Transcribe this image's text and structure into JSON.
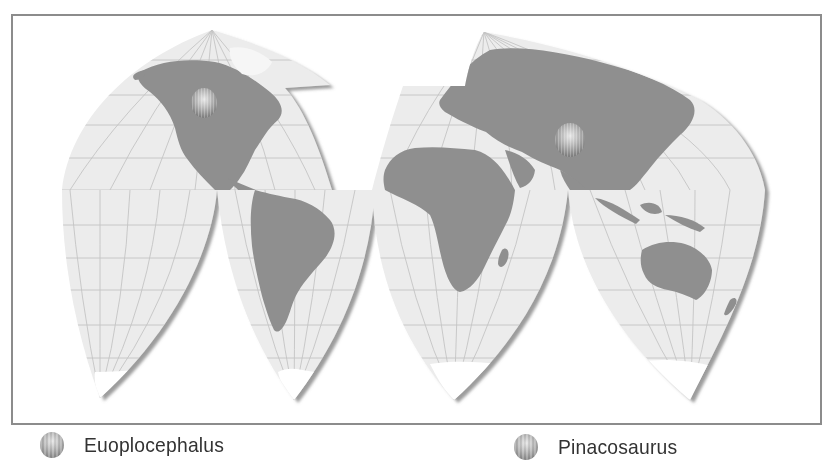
{
  "map": {
    "title": "",
    "projection": "interrupted-homolosine",
    "colors": {
      "ocean": "#ececec",
      "land": "#8f8f8f",
      "ice": "#ffffff",
      "graticule": "#c4c4c4",
      "frame": "#8c8c8c",
      "shadow": "#555555"
    },
    "markers": [
      {
        "name": "Euoplocephalus",
        "region": "western North America",
        "x": 204,
        "y": 103,
        "r": 14
      },
      {
        "name": "Pinacosaurus",
        "region": "central Asia (Mongolia/China)",
        "x": 570,
        "y": 140,
        "r": 16
      }
    ]
  },
  "legend": {
    "items": [
      {
        "label": "Euoplocephalus",
        "icon": "sphere-marker-icon"
      },
      {
        "label": "Pinacosaurus",
        "icon": "sphere-marker-icon"
      }
    ]
  }
}
